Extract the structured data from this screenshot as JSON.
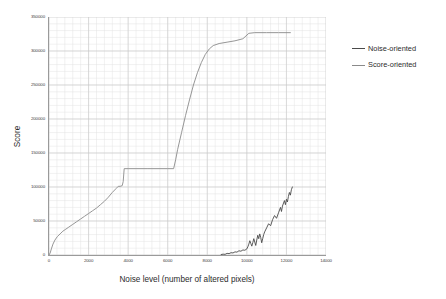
{
  "chart_data": {
    "type": "line",
    "title": "",
    "xlabel": "Noise level (number of altered pixels)",
    "ylabel": "Score",
    "xlim": [
      0,
      14000
    ],
    "ylim": [
      0,
      350000
    ],
    "xticks": [
      0,
      2000,
      4000,
      6000,
      8000,
      10000,
      12000,
      14000
    ],
    "xtick_labels": [
      "0",
      "2000",
      "4000",
      "6000",
      "8000",
      "10000",
      "12000",
      "14000"
    ],
    "yticks": [
      0,
      50000,
      100000,
      150000,
      200000,
      250000,
      300000,
      350000
    ],
    "ytick_labels": [
      "0",
      "50000",
      "100000",
      "150000",
      "200000",
      "250000",
      "300000",
      "350000"
    ],
    "grid": true,
    "grid_minor": true,
    "legend_position": "right",
    "colors": {
      "noise_oriented": "#4a4a4a",
      "score_oriented": "#8a8a8a",
      "grid_major": "#c9c9c9",
      "grid_minor": "#e3e3e3",
      "axis": "#9a9a9a"
    },
    "series": [
      {
        "name": "Noise-oriented",
        "color": "#4a4a4a",
        "points": [
          [
            8700,
            700
          ],
          [
            8800,
            1200
          ],
          [
            8900,
            1000
          ],
          [
            9000,
            2400
          ],
          [
            9100,
            2000
          ],
          [
            9200,
            3400
          ],
          [
            9300,
            3000
          ],
          [
            9400,
            4600
          ],
          [
            9500,
            4200
          ],
          [
            9600,
            6200
          ],
          [
            9700,
            5600
          ],
          [
            9800,
            7400
          ],
          [
            9900,
            7000
          ],
          [
            10000,
            9000
          ],
          [
            10050,
            12000
          ],
          [
            10100,
            16000
          ],
          [
            10150,
            21000
          ],
          [
            10200,
            17000
          ],
          [
            10250,
            13000
          ],
          [
            10300,
            18000
          ],
          [
            10350,
            24000
          ],
          [
            10400,
            19000
          ],
          [
            10450,
            14000
          ],
          [
            10500,
            22000
          ],
          [
            10550,
            29000
          ],
          [
            10600,
            24000
          ],
          [
            10650,
            31000
          ],
          [
            10700,
            26000
          ],
          [
            10750,
            18000
          ],
          [
            10800,
            24000
          ],
          [
            10850,
            30000
          ],
          [
            10900,
            34000
          ],
          [
            11000,
            40000
          ],
          [
            11100,
            46000
          ],
          [
            11200,
            43000
          ],
          [
            11300,
            52000
          ],
          [
            11400,
            58000
          ],
          [
            11500,
            54000
          ],
          [
            11600,
            62000
          ],
          [
            11700,
            70000
          ],
          [
            11750,
            64000
          ],
          [
            11800,
            72000
          ],
          [
            11900,
            80000
          ],
          [
            11950,
            74000
          ],
          [
            12000,
            82000
          ],
          [
            12050,
            78000
          ],
          [
            12100,
            86000
          ],
          [
            12150,
            92000
          ],
          [
            12200,
            88000
          ],
          [
            12250,
            96000
          ],
          [
            12300,
            100000
          ]
        ]
      },
      {
        "name": "Score-oriented",
        "color": "#8a8a8a",
        "points": [
          [
            0,
            0
          ],
          [
            60,
            3000
          ],
          [
            120,
            9000
          ],
          [
            200,
            16000
          ],
          [
            300,
            22000
          ],
          [
            420,
            27000
          ],
          [
            560,
            31000
          ],
          [
            700,
            35000
          ],
          [
            850,
            38000
          ],
          [
            1000,
            41000
          ],
          [
            1200,
            45000
          ],
          [
            1400,
            49000
          ],
          [
            1600,
            53000
          ],
          [
            1800,
            57000
          ],
          [
            2000,
            61000
          ],
          [
            2200,
            65000
          ],
          [
            2400,
            69000
          ],
          [
            2600,
            74000
          ],
          [
            2800,
            79000
          ],
          [
            3000,
            85000
          ],
          [
            3200,
            92000
          ],
          [
            3400,
            98000
          ],
          [
            3500,
            101000
          ],
          [
            3600,
            101000
          ],
          [
            3700,
            102000
          ],
          [
            3750,
            108000
          ],
          [
            3800,
            127000
          ],
          [
            4000,
            127000
          ],
          [
            5000,
            127000
          ],
          [
            6000,
            127000
          ],
          [
            6300,
            127000
          ],
          [
            6400,
            140000
          ],
          [
            6500,
            155000
          ],
          [
            6700,
            180000
          ],
          [
            6900,
            205000
          ],
          [
            7100,
            228000
          ],
          [
            7300,
            250000
          ],
          [
            7500,
            268000
          ],
          [
            7700,
            283000
          ],
          [
            7900,
            295000
          ],
          [
            8100,
            303000
          ],
          [
            8300,
            308000
          ],
          [
            8600,
            311000
          ],
          [
            9000,
            313000
          ],
          [
            9400,
            315000
          ],
          [
            9800,
            318000
          ],
          [
            10100,
            326000
          ],
          [
            10400,
            327000
          ],
          [
            11000,
            327000
          ],
          [
            11600,
            327000
          ],
          [
            12200,
            327000
          ]
        ]
      }
    ]
  },
  "legend": {
    "items": [
      {
        "label": "Noise-oriented"
      },
      {
        "label": "Score-oriented"
      }
    ]
  }
}
